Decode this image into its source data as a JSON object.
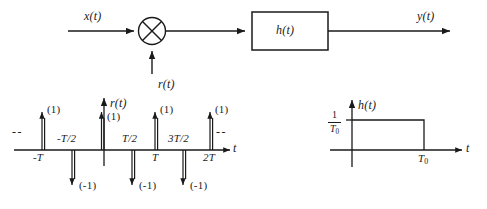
{
  "block_diagram": {
    "input_label": "x(t)",
    "carrier_label": "r(t)",
    "multiplier_symbol": "multiplier-x",
    "filter_label": "h(t)",
    "output_label": "y(t)"
  },
  "impulse_plot": {
    "signal_label": "r(t)",
    "axis_label": "t",
    "left_ellipsis": "--",
    "right_ellipsis": "--",
    "positive_weight": "(1)",
    "negative_weight": "(-1)",
    "tick_labels": {
      "minus_T": "-T",
      "minus_T_over_2": "-T/2",
      "T_over_2": "T/2",
      "T": "T",
      "three_T_over_2": "3T/2",
      "two_T": "2T"
    }
  },
  "impulse_data": {
    "type": "stem",
    "xlabel": "t",
    "ylabel": "r(t)",
    "impulses": [
      {
        "x": "-T",
        "weight": 1,
        "label": "(1)"
      },
      {
        "x": "-T/2",
        "weight": -1,
        "label": "(-1)"
      },
      {
        "x": "0",
        "weight": 1,
        "label": "(1)"
      },
      {
        "x": "T/2",
        "weight": -1,
        "label": "(-1)"
      },
      {
        "x": "T",
        "weight": 1,
        "label": "(1)"
      },
      {
        "x": "3T/2",
        "weight": -1,
        "label": "(-1)"
      },
      {
        "x": "2T",
        "weight": 1,
        "label": "(1)"
      }
    ]
  },
  "filter_plot": {
    "signal_label": "h(t)",
    "axis_label": "t",
    "amplitude_numerator": "1",
    "amplitude_denominator": "T",
    "amplitude_denominator_sub": "0",
    "duration_label": "T",
    "duration_label_sub": "0"
  },
  "filter_data": {
    "type": "line",
    "xlabel": "t",
    "ylabel": "h(t)",
    "amplitude": "1/T0",
    "start": "0",
    "end": "T0"
  }
}
